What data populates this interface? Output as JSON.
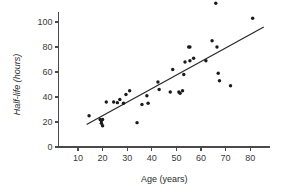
{
  "chart_data": {
    "type": "scatter",
    "title": "",
    "xlabel": "Age (years)",
    "ylabel": "Half-life (hours)",
    "xlim": [
      0,
      88
    ],
    "ylim": [
      0,
      108
    ],
    "xticks": [
      10,
      20,
      30,
      40,
      50,
      60,
      70,
      80
    ],
    "yticks": [
      0,
      20,
      40,
      60,
      80,
      100
    ],
    "grid": false,
    "legend": null,
    "points": [
      {
        "x": 14.5,
        "y": 25
      },
      {
        "x": 19,
        "y": 22
      },
      {
        "x": 19.5,
        "y": 21
      },
      {
        "x": 19.5,
        "y": 19
      },
      {
        "x": 20,
        "y": 22
      },
      {
        "x": 20,
        "y": 17
      },
      {
        "x": 21.5,
        "y": 36
      },
      {
        "x": 24.5,
        "y": 36
      },
      {
        "x": 26,
        "y": 35.5
      },
      {
        "x": 27,
        "y": 38
      },
      {
        "x": 28.5,
        "y": 35
      },
      {
        "x": 29.5,
        "y": 42
      },
      {
        "x": 31,
        "y": 45
      },
      {
        "x": 34,
        "y": 19.5
      },
      {
        "x": 36,
        "y": 34
      },
      {
        "x": 38,
        "y": 41
      },
      {
        "x": 38.5,
        "y": 35
      },
      {
        "x": 42.5,
        "y": 52
      },
      {
        "x": 43,
        "y": 46
      },
      {
        "x": 47.5,
        "y": 44
      },
      {
        "x": 48.5,
        "y": 62
      },
      {
        "x": 51,
        "y": 44
      },
      {
        "x": 51.5,
        "y": 43
      },
      {
        "x": 52.5,
        "y": 45
      },
      {
        "x": 53,
        "y": 58
      },
      {
        "x": 53.5,
        "y": 68
      },
      {
        "x": 55,
        "y": 80
      },
      {
        "x": 55.5,
        "y": 80
      },
      {
        "x": 55.5,
        "y": 69
      },
      {
        "x": 57,
        "y": 71
      },
      {
        "x": 62,
        "y": 69
      },
      {
        "x": 64.5,
        "y": 85
      },
      {
        "x": 66,
        "y": 115
      },
      {
        "x": 66.5,
        "y": 80
      },
      {
        "x": 67,
        "y": 59
      },
      {
        "x": 67.5,
        "y": 53
      },
      {
        "x": 72,
        "y": 49
      },
      {
        "x": 81,
        "y": 103
      }
    ],
    "fit_line": {
      "label": "regression line",
      "x_start": 13.5,
      "y_start": 18,
      "x_end": 85.5,
      "y_end": 96
    }
  }
}
